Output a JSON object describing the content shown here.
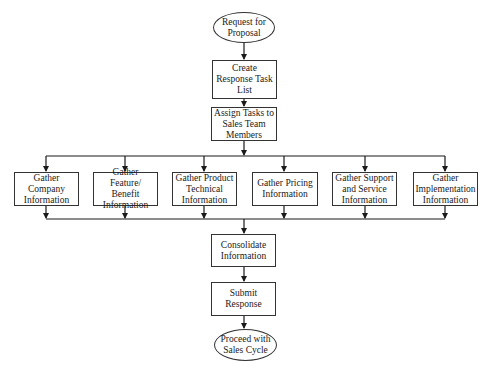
{
  "diagram": {
    "type": "flowchart",
    "nodes": {
      "start": {
        "label": "Request for\nProposal",
        "shape": "terminal"
      },
      "create": {
        "label": "Create\nResponse Task\nList",
        "shape": "process"
      },
      "assign": {
        "label": "Assign Tasks to\nSales Team\nMembers",
        "shape": "process"
      },
      "company": {
        "label": "Gather\nCompany\nInformation",
        "shape": "process"
      },
      "feature": {
        "label": "Gather Feature/\nBenefit\nInformation",
        "shape": "process"
      },
      "product": {
        "label": "Gather Product\nTechnical\nInformation",
        "shape": "process"
      },
      "pricing": {
        "label": "Gather Pricing\nInformation",
        "shape": "process"
      },
      "support": {
        "label": "Gather Support\nand Service\nInformation",
        "shape": "process"
      },
      "implementation": {
        "label": "Gather\nImplementation\nInformation",
        "shape": "process"
      },
      "consolidate": {
        "label": "Consolidate\nInformation",
        "shape": "process"
      },
      "submit": {
        "label": "Submit\nResponse",
        "shape": "process"
      },
      "end": {
        "label": "Proceed with\nSales Cycle",
        "shape": "terminal"
      }
    },
    "edges": [
      [
        "start",
        "create"
      ],
      [
        "create",
        "assign"
      ],
      [
        "assign",
        "company"
      ],
      [
        "assign",
        "feature"
      ],
      [
        "assign",
        "product"
      ],
      [
        "assign",
        "pricing"
      ],
      [
        "assign",
        "support"
      ],
      [
        "assign",
        "implementation"
      ],
      [
        "company",
        "consolidate"
      ],
      [
        "feature",
        "consolidate"
      ],
      [
        "product",
        "consolidate"
      ],
      [
        "pricing",
        "consolidate"
      ],
      [
        "support",
        "consolidate"
      ],
      [
        "implementation",
        "consolidate"
      ],
      [
        "consolidate",
        "submit"
      ],
      [
        "submit",
        "end"
      ]
    ],
    "colors": {
      "line": "#1a1a1a",
      "fill": "#ffffff"
    }
  }
}
